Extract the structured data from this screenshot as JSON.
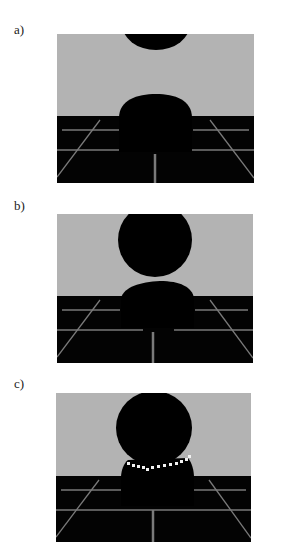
{
  "figure": {
    "panels": [
      {
        "label": "a)",
        "label_x": 14,
        "label_y": 22,
        "box": {
          "x": 57,
          "y": 34,
          "w": 197,
          "h": 149
        },
        "horizon_y": 116
      },
      {
        "label": "b)",
        "label_x": 14,
        "label_y": 198,
        "box": {
          "x": 57,
          "y": 214,
          "w": 196,
          "h": 149
        },
        "horizon_y": 296
      },
      {
        "label": "c)",
        "label_x": 14,
        "label_y": 376,
        "box": {
          "x": 56,
          "y": 393,
          "w": 195,
          "h": 149
        },
        "horizon_y": 476
      }
    ],
    "colors": {
      "background": "#b3b3b3",
      "floor": "#030303",
      "grid": "#7a7a7a",
      "drop": "#000000",
      "contour_dots": "#f2f2f2",
      "page": "#ffffff"
    }
  }
}
